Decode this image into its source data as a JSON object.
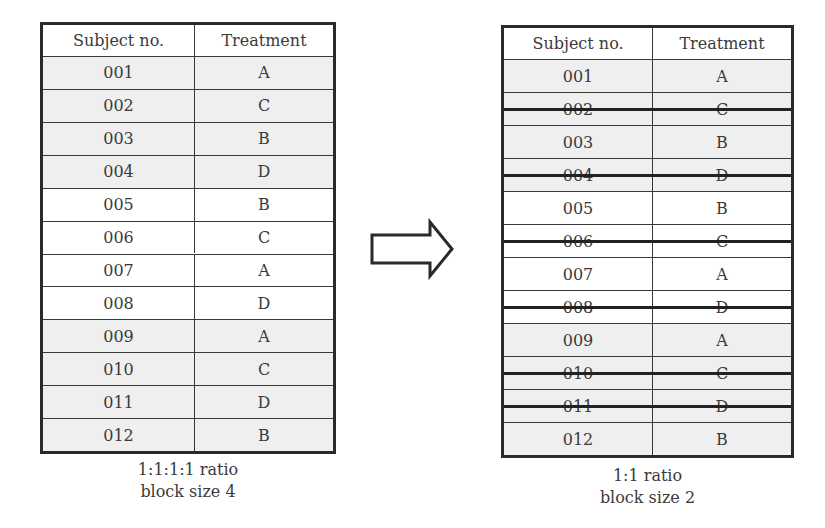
{
  "left_table": {
    "headers": [
      "Subject no.",
      "Treatment"
    ],
    "rows": [
      {
        "subject": "001",
        "treatment": "A",
        "shade": "grey"
      },
      {
        "subject": "002",
        "treatment": "C",
        "shade": "grey"
      },
      {
        "subject": "003",
        "treatment": "B",
        "shade": "grey"
      },
      {
        "subject": "004",
        "treatment": "D",
        "shade": "grey"
      },
      {
        "subject": "005",
        "treatment": "B",
        "shade": "white"
      },
      {
        "subject": "006",
        "treatment": "C",
        "shade": "white"
      },
      {
        "subject": "007",
        "treatment": "A",
        "shade": "white"
      },
      {
        "subject": "008",
        "treatment": "D",
        "shade": "white"
      },
      {
        "subject": "009",
        "treatment": "A",
        "shade": "grey"
      },
      {
        "subject": "010",
        "treatment": "C",
        "shade": "grey"
      },
      {
        "subject": "011",
        "treatment": "D",
        "shade": "grey"
      },
      {
        "subject": "012",
        "treatment": "B",
        "shade": "grey"
      }
    ],
    "caption_line1": "1:1:1:1 ratio",
    "caption_line2": "block size 4"
  },
  "right_table": {
    "headers": [
      "Subject no.",
      "Treatment"
    ],
    "rows": [
      {
        "subject": "001",
        "treatment": "A",
        "shade": "grey",
        "struck": false
      },
      {
        "subject": "002",
        "treatment": "C",
        "shade": "grey",
        "struck": true
      },
      {
        "subject": "003",
        "treatment": "B",
        "shade": "grey",
        "struck": false
      },
      {
        "subject": "004",
        "treatment": "D",
        "shade": "grey",
        "struck": true
      },
      {
        "subject": "005",
        "treatment": "B",
        "shade": "white",
        "struck": false
      },
      {
        "subject": "006",
        "treatment": "C",
        "shade": "white",
        "struck": true
      },
      {
        "subject": "007",
        "treatment": "A",
        "shade": "white",
        "struck": false
      },
      {
        "subject": "008",
        "treatment": "D",
        "shade": "white",
        "struck": true
      },
      {
        "subject": "009",
        "treatment": "A",
        "shade": "grey",
        "struck": false
      },
      {
        "subject": "010",
        "treatment": "C",
        "shade": "grey",
        "struck": true
      },
      {
        "subject": "011",
        "treatment": "D",
        "shade": "grey",
        "struck": true
      },
      {
        "subject": "012",
        "treatment": "B",
        "shade": "grey",
        "struck": false
      }
    ],
    "caption_line1": "1:1 ratio",
    "caption_line2": "block size 2"
  },
  "arrow": {
    "icon": "right-arrow-icon",
    "direction": "right"
  }
}
